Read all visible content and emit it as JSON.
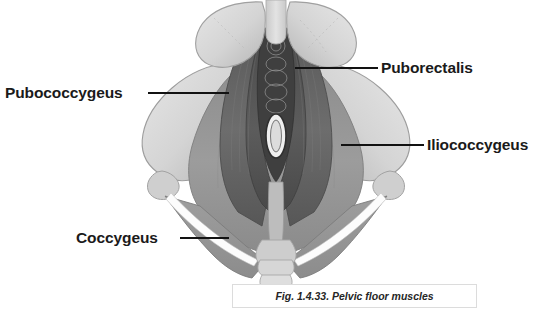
{
  "figure": {
    "caption": "Fig. 1.4.33. Pelvic floor muscles",
    "background_color": "#ffffff",
    "labels": [
      {
        "id": "pubococcygeus",
        "text": "Pubococcygeus",
        "position": "left-upper",
        "leader_line": {
          "x1": 148,
          "y1": 93,
          "x2": 229,
          "y2": 93
        }
      },
      {
        "id": "puborectalis",
        "text": "Puborectalis",
        "position": "right-upper",
        "leader_line": {
          "x1": 295,
          "y1": 68,
          "x2": 378,
          "y2": 68
        }
      },
      {
        "id": "iliococcygeus",
        "text": "Iliococcygeus",
        "position": "right-middle",
        "leader_line": {
          "x1": 341,
          "y1": 145,
          "x2": 424,
          "y2": 145
        }
      },
      {
        "id": "coccygeus",
        "text": "Coccygeus",
        "position": "left-lower",
        "leader_line": {
          "x1": 180,
          "y1": 238,
          "x2": 229,
          "y2": 238
        }
      }
    ],
    "colors": {
      "bone_light": "#dcdcdc",
      "bone_mid": "#c4c4c4",
      "bone_shadow": "#a8a8a8",
      "muscle_iliococcygeus": "#9a9a9a",
      "muscle_pubococcygeus": "#6e6e6e",
      "muscle_puborectalis": "#5a5a5a",
      "muscle_dark": "#4a4a4a",
      "midline_dark": "#3a3a3a",
      "coccygeus": "#949494",
      "leader_line": "#121212",
      "label_text": "#1a1a1a",
      "caption_text": "#262626",
      "caption_border": "#dcdcdc"
    },
    "anatomy_regions": [
      {
        "name": "pubic-bone-left",
        "type": "bone"
      },
      {
        "name": "pubic-bone-right",
        "type": "bone"
      },
      {
        "name": "pubic-symphysis",
        "type": "bone"
      },
      {
        "name": "ilium-left",
        "type": "bone"
      },
      {
        "name": "ilium-right",
        "type": "bone"
      },
      {
        "name": "ischial-spine-left",
        "type": "bone"
      },
      {
        "name": "ischial-spine-right",
        "type": "bone"
      },
      {
        "name": "sacrum",
        "type": "bone"
      },
      {
        "name": "coccyx",
        "type": "bone"
      },
      {
        "name": "pubococcygeus-muscle",
        "type": "muscle"
      },
      {
        "name": "puborectalis-muscle",
        "type": "muscle"
      },
      {
        "name": "iliococcygeus-muscle",
        "type": "muscle"
      },
      {
        "name": "coccygeus-muscle-left",
        "type": "muscle"
      },
      {
        "name": "coccygeus-muscle-right",
        "type": "muscle"
      },
      {
        "name": "urogenital-hiatus",
        "type": "opening"
      },
      {
        "name": "anal-canal",
        "type": "opening"
      }
    ]
  }
}
